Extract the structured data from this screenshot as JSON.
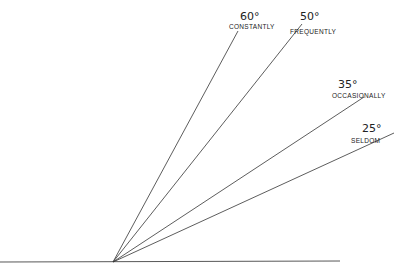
{
  "diagram": {
    "origin": {
      "x": 113,
      "y": 262
    },
    "baseline": {
      "x1": 0,
      "y1": 262,
      "x2": 340,
      "y2": 261
    },
    "line_color": "#333333",
    "rays": [
      {
        "angle_label": "60°",
        "frequency_label": "CONSTANTLY",
        "end": {
          "x": 238,
          "y": 31
        },
        "angle_pos": {
          "x": 240,
          "y": 20
        },
        "label_pos": {
          "x": 229,
          "y": 29
        }
      },
      {
        "angle_label": "50°",
        "frequency_label": "FREQUENTLY",
        "end": {
          "x": 302,
          "y": 24
        },
        "angle_pos": {
          "x": 300,
          "y": 20
        },
        "label_pos": {
          "x": 290,
          "y": 34
        }
      },
      {
        "angle_label": "35°",
        "frequency_label": "OCCASIONALLY",
        "end": {
          "x": 364,
          "y": 97
        },
        "angle_pos": {
          "x": 338,
          "y": 88
        },
        "label_pos": {
          "x": 332,
          "y": 98
        }
      },
      {
        "angle_label": "25°",
        "frequency_label": "SELDOM",
        "end": {
          "x": 394,
          "y": 133
        },
        "angle_pos": {
          "x": 362,
          "y": 132
        },
        "label_pos": {
          "x": 351,
          "y": 143
        }
      }
    ]
  }
}
